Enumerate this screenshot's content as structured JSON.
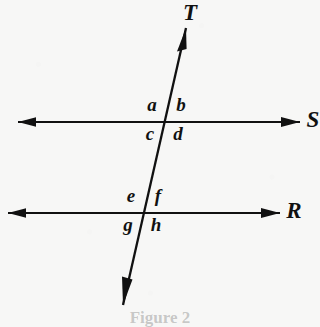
{
  "figure": {
    "type": "geometry-diagram",
    "background_color": "#f7f7f6",
    "ink_color": "#111111",
    "caption_partial": "Figure 2"
  },
  "lines": [
    {
      "id": "line-s",
      "label": "S",
      "orientation": "horizontal",
      "y": 122,
      "x_start": 18,
      "x_end": 300,
      "arrow_start": true,
      "arrow_end": true,
      "label_x": 313,
      "label_y": 131,
      "label_clipped": true
    },
    {
      "id": "line-r",
      "label": "R",
      "orientation": "horizontal",
      "y": 213,
      "x_start": 8,
      "x_end": 280,
      "arrow_start": true,
      "arrow_end": true,
      "label_x": 294,
      "label_y": 222,
      "label_clipped": false
    },
    {
      "id": "line-t",
      "label": "T",
      "orientation": "transversal",
      "x_top": 186,
      "y_top": 28,
      "x_bottom": 123,
      "y_bottom": 305,
      "arrow_start": true,
      "arrow_end": true,
      "label_x": 190,
      "label_y": 24
    }
  ],
  "intersections": [
    {
      "id": "intersection-upper",
      "with_line": "S",
      "x": 164,
      "y": 122
    },
    {
      "id": "intersection-lower",
      "with_line": "R",
      "x": 143,
      "y": 213
    }
  ],
  "angle_labels": [
    {
      "id": "angle-a",
      "text": "a",
      "x": 152,
      "y": 114,
      "position": "upper-left",
      "intersection": "intersection-upper"
    },
    {
      "id": "angle-b",
      "text": "b",
      "x": 181,
      "y": 114,
      "position": "upper-right",
      "intersection": "intersection-upper"
    },
    {
      "id": "angle-c",
      "text": "c",
      "x": 150,
      "y": 143,
      "position": "lower-left",
      "intersection": "intersection-upper"
    },
    {
      "id": "angle-d",
      "text": "d",
      "x": 178,
      "y": 143,
      "position": "lower-right",
      "intersection": "intersection-upper"
    },
    {
      "id": "angle-e",
      "text": "e",
      "x": 131,
      "y": 205,
      "position": "upper-left",
      "intersection": "intersection-lower"
    },
    {
      "id": "angle-f",
      "text": "f",
      "x": 158,
      "y": 205,
      "position": "upper-right",
      "intersection": "intersection-lower"
    },
    {
      "id": "angle-g",
      "text": "g",
      "x": 128,
      "y": 234,
      "position": "lower-left",
      "intersection": "intersection-lower"
    },
    {
      "id": "angle-h",
      "text": "h",
      "x": 156,
      "y": 234,
      "position": "lower-right",
      "intersection": "intersection-lower"
    }
  ]
}
